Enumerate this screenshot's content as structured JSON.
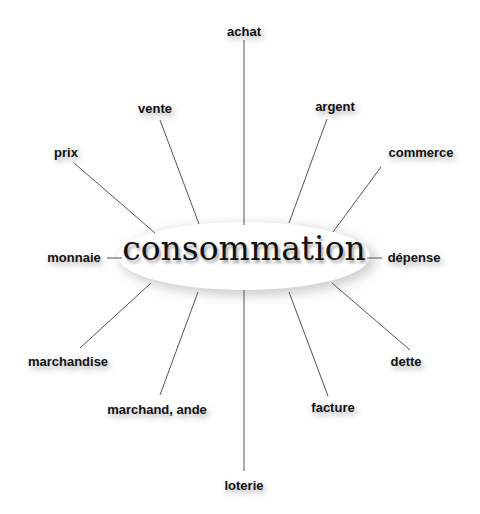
{
  "diagram": {
    "center": "consommation",
    "line_color": "#555555",
    "labels": [
      {
        "id": "achat",
        "text": "achat",
        "x": 244,
        "y": 31
      },
      {
        "id": "vente",
        "text": "vente",
        "x": 155,
        "y": 108
      },
      {
        "id": "argent",
        "text": "argent",
        "x": 335,
        "y": 106
      },
      {
        "id": "prix",
        "text": "prix",
        "x": 66,
        "y": 152
      },
      {
        "id": "commerce",
        "text": "commerce",
        "x": 421,
        "y": 152
      },
      {
        "id": "monnaie",
        "text": "monnaie",
        "x": 74,
        "y": 257
      },
      {
        "id": "depense",
        "text": "dépense",
        "x": 414,
        "y": 257
      },
      {
        "id": "marchandise",
        "text": "marchandise",
        "x": 68,
        "y": 361
      },
      {
        "id": "dette",
        "text": "dette",
        "x": 406,
        "y": 361
      },
      {
        "id": "marchand",
        "text": "marchand, ande",
        "x": 157,
        "y": 409
      },
      {
        "id": "facture",
        "text": "facture",
        "x": 333,
        "y": 407
      },
      {
        "id": "loterie",
        "text": "loterie",
        "x": 244,
        "y": 485
      }
    ]
  }
}
